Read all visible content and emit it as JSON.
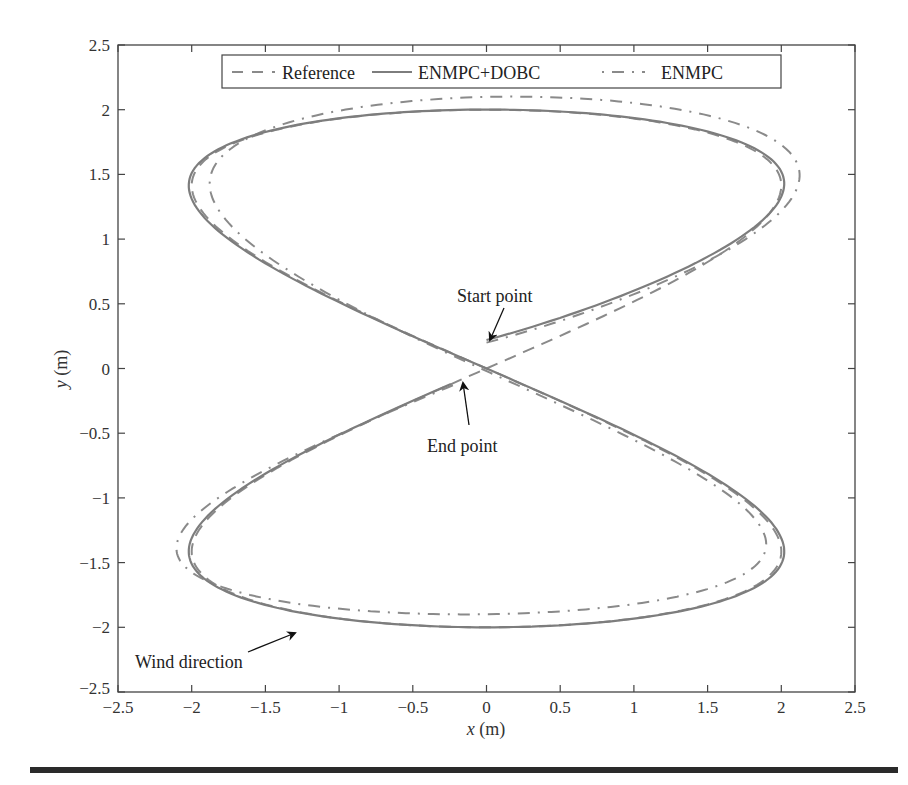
{
  "chart_data": {
    "type": "line",
    "title": "",
    "xlabel": "x (m)",
    "ylabel": "y (m)",
    "xlim": [
      -2.5,
      2.5
    ],
    "ylim": [
      -2.5,
      2.5
    ],
    "xticks": [
      "-2.5",
      "-2",
      "-1.5",
      "-1",
      "-0.5",
      "0",
      "0.5",
      "1",
      "1.5",
      "2",
      "2.5"
    ],
    "yticks": [
      "2.5",
      "2",
      "1.5",
      "1",
      "0.5",
      "0",
      "-0.5",
      "-1",
      "-1.5",
      "-2",
      "-2.5"
    ],
    "grid": false,
    "legend_position": "top-center",
    "series": [
      {
        "name": "Reference",
        "style": "dashed",
        "color": "#808080",
        "description": "figure-eight x=2sin(2t), y=2sin(t)",
        "x": [
          0,
          1.41,
          2,
          1.41,
          0,
          -1.41,
          -2,
          -1.41,
          0,
          1.41,
          2,
          1.41,
          0,
          -1.41,
          -2,
          -1.41,
          0
        ],
        "y": [
          0,
          0.77,
          1.41,
          1.85,
          2,
          1.85,
          1.41,
          0.77,
          0,
          -0.77,
          -1.41,
          -1.85,
          -2,
          -1.85,
          -1.41,
          -0.77,
          0
        ]
      },
      {
        "name": "ENMPC+DOBC",
        "style": "solid",
        "color": "#808080",
        "x": [
          0,
          1.41,
          2.02,
          1.41,
          0,
          -1.41,
          -2.03,
          -1.41,
          0,
          1.41,
          2.02,
          1.41,
          0,
          -1.41,
          -2.04,
          -1.41,
          -0.15
        ],
        "y": [
          0.22,
          0.6,
          1.4,
          1.85,
          2.0,
          1.85,
          1.4,
          0.77,
          0.02,
          -0.77,
          -1.4,
          -1.85,
          -2.0,
          -1.85,
          -1.4,
          -0.77,
          -0.05
        ]
      },
      {
        "name": "ENMPC",
        "style": "dashdot",
        "color": "#808080",
        "x": [
          0,
          1.5,
          2.18,
          1.6,
          0,
          -1.3,
          -1.85,
          -1.3,
          0,
          1.5,
          2.18,
          1.6,
          0,
          -1.3,
          -1.85,
          -1.3,
          -0.1
        ],
        "y": [
          0.22,
          0.7,
          1.5,
          1.95,
          2.13,
          1.95,
          1.5,
          0.9,
          0.1,
          -0.7,
          -1.35,
          -1.75,
          -1.88,
          -1.75,
          -1.35,
          -0.7,
          -0.03
        ]
      }
    ],
    "annotations": [
      {
        "text": "Start point",
        "x": 0.0,
        "y": 0.22
      },
      {
        "text": "End point",
        "x": -0.15,
        "y": -0.05
      },
      {
        "text": "Wind direction",
        "x": -1.3,
        "y": -2.0
      }
    ]
  },
  "legend": {
    "items": [
      "Reference",
      "ENMPC+DOBC",
      "ENMPC"
    ]
  },
  "axes": {
    "xlabel_var": "x",
    "xlabel_unit": " (m)",
    "ylabel_var": "y",
    "ylabel_unit": " (m)"
  },
  "annotations": {
    "start": "Start point",
    "end": "End point",
    "wind": "Wind direction"
  }
}
